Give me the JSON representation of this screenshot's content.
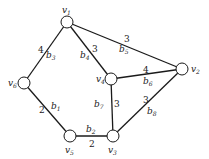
{
  "diagram": {
    "type": "weighted-graph",
    "nodes": [
      {
        "id": "v1",
        "name": "v",
        "sub": "1",
        "x": 67,
        "y": 22
      },
      {
        "id": "v2",
        "name": "v",
        "sub": "2",
        "x": 182,
        "y": 69
      },
      {
        "id": "v3",
        "name": "v",
        "sub": "3",
        "x": 113,
        "y": 136
      },
      {
        "id": "v4",
        "name": "v",
        "sub": "4",
        "x": 111,
        "y": 79
      },
      {
        "id": "v5",
        "name": "v",
        "sub": "5",
        "x": 70,
        "y": 136
      },
      {
        "id": "v6",
        "name": "v",
        "sub": "6",
        "x": 24,
        "y": 83
      }
    ],
    "edges": [
      {
        "id": "b1",
        "name": "b",
        "sub": "1",
        "from": "v6",
        "to": "v5",
        "weight": "2"
      },
      {
        "id": "b2",
        "name": "b",
        "sub": "2",
        "from": "v5",
        "to": "v3",
        "weight": "2"
      },
      {
        "id": "b3",
        "name": "b",
        "sub": "3",
        "from": "v1",
        "to": "v6",
        "weight": "4"
      },
      {
        "id": "b4",
        "name": "b",
        "sub": "4",
        "from": "v1",
        "to": "v4",
        "weight": "3"
      },
      {
        "id": "b5",
        "name": "b",
        "sub": "5",
        "from": "v1",
        "to": "v2",
        "weight": "3"
      },
      {
        "id": "b6",
        "name": "b",
        "sub": "6",
        "from": "v4",
        "to": "v2",
        "weight": "4"
      },
      {
        "id": "b7",
        "name": "b",
        "sub": "7",
        "from": "v4",
        "to": "v3",
        "weight": "3"
      },
      {
        "id": "b8",
        "name": "b",
        "sub": "8",
        "from": "v3",
        "to": "v2",
        "weight": "3"
      }
    ]
  }
}
